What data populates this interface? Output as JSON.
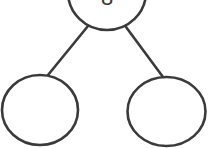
{
  "diagram": {
    "type": "binary-tree",
    "stroke_color": "#3a3a3a",
    "background": "#ffffff",
    "nodes": [
      {
        "id": "root",
        "label": "8",
        "cx": 107,
        "cy": -8,
        "rx": 39,
        "ry": 38
      },
      {
        "id": "left-child",
        "label": "",
        "cx": 40,
        "cy": 110,
        "rx": 38,
        "ry": 35
      },
      {
        "id": "right-child",
        "label": "",
        "cx": 166.5,
        "cy": 111.5,
        "rx": 39,
        "ry": 34.5
      }
    ],
    "edges": [
      {
        "from": "root",
        "to": "left-child",
        "x1": 88,
        "y1": 26,
        "x2": 48,
        "y2": 75
      },
      {
        "from": "root",
        "to": "right-child",
        "x1": 126,
        "y1": 27,
        "x2": 163,
        "y2": 77
      }
    ]
  }
}
